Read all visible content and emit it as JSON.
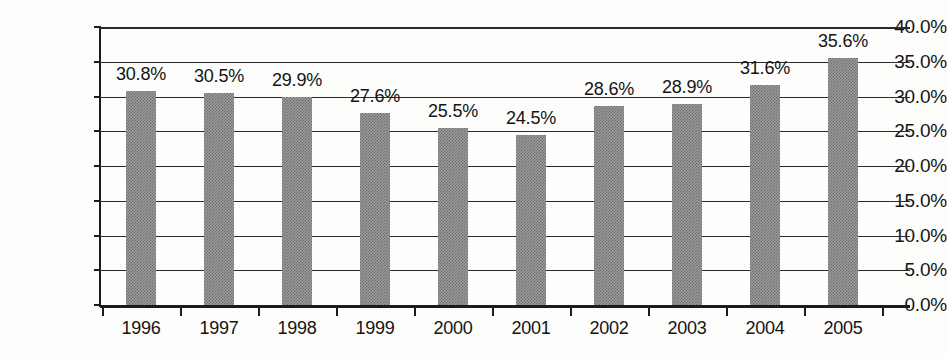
{
  "chart_data": {
    "type": "bar",
    "title": "",
    "subtitle": "",
    "xlabel": "",
    "ylabel": "",
    "categories": [
      "1996",
      "1997",
      "1998",
      "1999",
      "2000",
      "2001",
      "2002",
      "2003",
      "2004",
      "2005"
    ],
    "values": [
      30.8,
      30.5,
      29.9,
      27.6,
      25.5,
      24.5,
      28.6,
      28.9,
      31.6,
      35.6
    ],
    "value_labels": [
      "30.8%",
      "30.5%",
      "29.9%",
      "27.6%",
      "25.5%",
      "24.5%",
      "28.6%",
      "28.9%",
      "31.6%",
      "35.6%"
    ],
    "ylim": [
      0,
      40
    ],
    "ytick_values": [
      0,
      5,
      10,
      15,
      20,
      25,
      30,
      35,
      40
    ],
    "ytick_labels": [
      "0.0%",
      "5.0%",
      "10.0%",
      "15.0%",
      "20.0%",
      "25.0%",
      "30.0%",
      "35.0%",
      "40.0%"
    ],
    "grid": true,
    "grid_axis": "y",
    "legend": false,
    "legend_position": "none",
    "bar_color": "#9b9b9b",
    "bar_pattern": "halftone-dither",
    "axis_color": "#1c1c1c",
    "grid_color": "#2b2b2b",
    "background_color": "#fdfdfc",
    "text_color": "#141414"
  }
}
